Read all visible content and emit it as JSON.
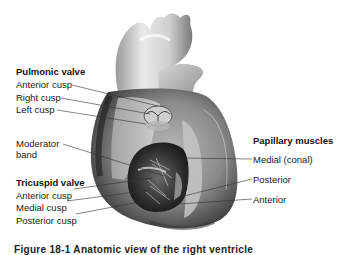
{
  "figure": {
    "pulmonic_valve": {
      "title": "Pulmonic valve",
      "labels": [
        "Anterior cusp",
        "Right cusp",
        "Left cusp"
      ]
    },
    "moderator_band": {
      "label_line1": "Moderator",
      "label_line2": "band"
    },
    "tricuspid_valve": {
      "title": "Tricuspid valve",
      "labels": [
        "Anterior cusp",
        "Medial cusp",
        "Posterior cusp"
      ]
    },
    "papillary_muscles": {
      "title": "Papillary muscles",
      "labels": [
        "Medial (conal)",
        "Posterior",
        "Anterior"
      ]
    },
    "caption": "Figure 18-1  Anatomic view of the right ventricle"
  }
}
